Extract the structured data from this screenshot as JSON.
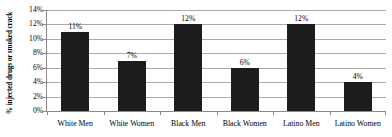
{
  "chart_data": {
    "type": "bar",
    "title": "",
    "xlabel": "",
    "ylabel": "% injected drugs or smoked crack",
    "categories": [
      "White Men",
      "White Women",
      "Black Men",
      "Black Women",
      "Latino Men",
      "Latino Women"
    ],
    "values": [
      11,
      7,
      12,
      6,
      12,
      4
    ],
    "data_labels": [
      "11%",
      "7%",
      "12%",
      "6%",
      "12%",
      "4%"
    ],
    "ylim": [
      0,
      14
    ],
    "ytick_values": [
      0,
      2,
      4,
      6,
      8,
      10,
      12,
      14
    ],
    "ytick_labels": [
      "0%",
      "2%",
      "4%",
      "6%",
      "8%",
      "10%",
      "12%",
      "14%"
    ],
    "grid": true,
    "legend": false,
    "legend_position": "none",
    "bar_color": "#1c1c1c",
    "gridline_color": "#aaaaaa",
    "axis_color": "#8a8a8a",
    "background_color": "#ffffff"
  }
}
